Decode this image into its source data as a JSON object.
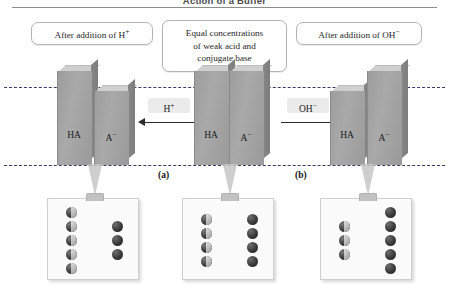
{
  "header": {
    "title": "Action of a Buffer"
  },
  "callouts": {
    "left": {
      "line1": "After addition of H",
      "sup1": "+"
    },
    "middle": {
      "line1": "Equal concentrations",
      "line2": "of weak acid and",
      "line3": "conjugate base"
    },
    "right": {
      "line1": "After addition of OH",
      "sup1": "−"
    }
  },
  "arrows": {
    "left": {
      "label": "H",
      "sup": "+",
      "direction": "left"
    },
    "right": {
      "label": "OH",
      "sup": "−",
      "direction": "right"
    }
  },
  "panels": [
    {
      "id": "left",
      "panel_label": "",
      "bars": [
        {
          "species": "HA",
          "label": "HA",
          "height": 78
        },
        {
          "species": "A-",
          "label": "A",
          "sup": "−",
          "height": 58
        }
      ],
      "box": {
        "ha_count": 5,
        "a_count": 3
      }
    },
    {
      "id": "middle",
      "panel_label": "(a)",
      "bars": [
        {
          "species": "HA",
          "label": "HA",
          "height": 78
        },
        {
          "species": "A-",
          "label": "A",
          "sup": "−",
          "height": 78
        }
      ],
      "box": {
        "ha_count": 4,
        "a_count": 4
      }
    },
    {
      "id": "right",
      "panel_label": "(b)",
      "bars": [
        {
          "species": "HA",
          "label": "HA",
          "height": 58
        },
        {
          "species": "A-",
          "label": "A",
          "sup": "−",
          "height": 78
        }
      ],
      "box": {
        "ha_count": 3,
        "a_count": 5
      }
    }
  ],
  "panel_labels": {
    "a": "(a)",
    "b": "(b)"
  },
  "reference_lines": {
    "top_label": "",
    "bottom_label": ""
  },
  "colors": {
    "bar_front": "#a2a2a2",
    "bar_top": "#cfcfcf",
    "bar_side": "#828282",
    "dashed_line": "#3a3a66",
    "box_background": "#fbfbfb",
    "sphere_dark": "#2a2a2a",
    "sphere_light": "#cfcfcf",
    "chip_background": "#ebebeb"
  },
  "chart_data": {
    "type": "bar",
    "title": "Action of a Buffer",
    "xlabel": "",
    "ylabel": "Relative concentration",
    "categories": [
      "HA",
      "A−"
    ],
    "series": [
      {
        "name": "After addition of H+",
        "values": [
          78,
          58
        ]
      },
      {
        "name": "Equal concentrations of weak acid and conjugate base",
        "values": [
          78,
          78
        ]
      },
      {
        "name": "After addition of OH−",
        "values": [
          58,
          78
        ]
      }
    ],
    "grid": false,
    "legend": "none",
    "annotations": [
      "Dashed reference lines mark the equal-concentration level and the baseline.",
      "Molecular views: left 5 HA / 3 A−, middle 4 HA / 4 A−, right 3 HA / 5 A−."
    ]
  }
}
